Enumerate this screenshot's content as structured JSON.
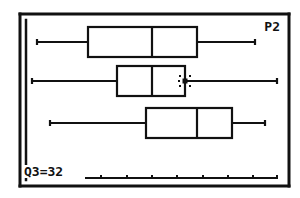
{
  "calculator": {
    "plot_indicator": "P2",
    "trace_readout": "Q3=32",
    "colors": {
      "ink": "#111111",
      "background": "#ffffff"
    }
  },
  "chart_data": {
    "type": "boxplot",
    "title": "",
    "orientation": "horizontal",
    "xlabel": "",
    "ylabel": "",
    "grid": false,
    "axis_ticks_count": 8,
    "series": [
      {
        "name": "Plot1",
        "min": 13,
        "q1": 19,
        "median": 26,
        "q3": 39,
        "max": 38.5,
        "px": {
          "y": 42,
          "wmin": 37,
          "q1": 88,
          "med": 152,
          "q3": 197,
          "wmax": 255
        }
      },
      {
        "name": "Plot2",
        "min": 12,
        "q1": 22,
        "median": 26,
        "q3": 32,
        "max": 41,
        "selected": true,
        "px": {
          "y": 81,
          "wmin": 32,
          "q1": 117,
          "med": 152,
          "q3": 185,
          "wmax": 277
        }
      },
      {
        "name": "Plot3",
        "min": 15,
        "q1": 27,
        "median": 32,
        "q3": 37,
        "max": 40,
        "px": {
          "y": 123,
          "wmin": 50,
          "q1": 146,
          "med": 197,
          "q3": 232,
          "wmax": 265
        }
      }
    ],
    "trace": {
      "plot": "P2",
      "stat": "Q3",
      "value": 32
    },
    "axis_px": {
      "y": 178,
      "x_start": 85,
      "x_end": 278,
      "ticks": [
        101,
        127,
        152,
        177,
        203,
        228,
        253,
        277
      ]
    }
  }
}
